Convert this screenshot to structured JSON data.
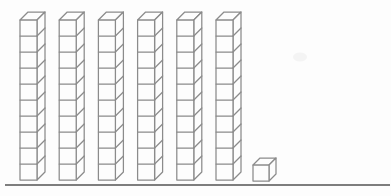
{
  "figure": {
    "tens_rods": 6,
    "cubes_per_rod": 10,
    "unit_cubes": 1,
    "value_represented": 61
  },
  "style": {
    "background": "#fdfdfd",
    "stroke_color": "#8b8b8b",
    "face_fill": "#fdfdfd",
    "stroke_width": 1.25,
    "baseline_color": "#7e7e7e"
  },
  "geometry": {
    "canvas_width": 391,
    "canvas_height": 196,
    "rod_start_x": 20,
    "rod_spacing": 39.2,
    "rod_bottom_y": 180,
    "cube_width": 17,
    "cube_height": 16,
    "depth_offset": 8,
    "unit_cube": {
      "x": 253,
      "bottom_y": 181,
      "size": 16,
      "depth_offset": 7
    },
    "baseline": {
      "x1": 5,
      "x2": 390,
      "y": 185,
      "width": 1.8
    },
    "scan_smudge": {
      "cx": 300,
      "cy": 57,
      "rx": 7,
      "ry": 4.5,
      "color": "#f4f4f4"
    }
  }
}
